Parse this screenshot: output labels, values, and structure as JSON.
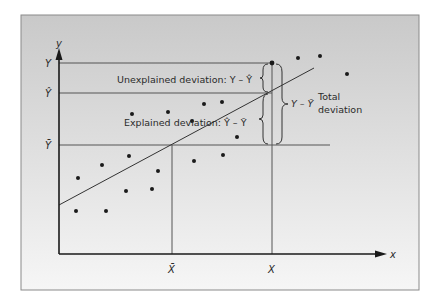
{
  "figure": {
    "frame": {
      "x": 21,
      "y": 15,
      "w": 398,
      "h": 275,
      "bg_top": "#c9c9c9",
      "bg_bottom": "#f6f6f6",
      "border": "#8a8a8a"
    },
    "axes": {
      "origin": {
        "x": 59,
        "y": 254
      },
      "y_top": 50,
      "x_right": 385,
      "y_axis_label": "y",
      "x_axis_label": "x",
      "color": "#1a1a1a"
    },
    "levels": {
      "Y": {
        "label": "Y",
        "y": 63,
        "x_end": 272
      },
      "Y_hat": {
        "label": "Ŷ",
        "y": 93,
        "x_end": 272
      },
      "Y_bar": {
        "label": "Ȳ",
        "y": 145,
        "x_end": 330
      }
    },
    "verticals": {
      "X_bar": {
        "label": "X̄",
        "x": 172
      },
      "X": {
        "label": "X",
        "x": 272
      }
    },
    "regression_line": {
      "x1": 59,
      "y1": 205,
      "x2": 314,
      "y2": 68
    },
    "highlight_point": {
      "x": 272,
      "y": 63
    },
    "points": [
      {
        "x": 76,
        "y": 211
      },
      {
        "x": 106,
        "y": 211
      },
      {
        "x": 78,
        "y": 178
      },
      {
        "x": 102,
        "y": 165
      },
      {
        "x": 126,
        "y": 191
      },
      {
        "x": 152,
        "y": 189
      },
      {
        "x": 158,
        "y": 171
      },
      {
        "x": 129,
        "y": 156
      },
      {
        "x": 132,
        "y": 114
      },
      {
        "x": 168,
        "y": 112
      },
      {
        "x": 194,
        "y": 161
      },
      {
        "x": 223,
        "y": 155
      },
      {
        "x": 204,
        "y": 104
      },
      {
        "x": 222,
        "y": 102
      },
      {
        "x": 192,
        "y": 121
      },
      {
        "x": 237,
        "y": 137
      },
      {
        "x": 298,
        "y": 58
      },
      {
        "x": 320,
        "y": 56
      },
      {
        "x": 347,
        "y": 74
      }
    ],
    "annotations": {
      "unexplained": {
        "text": "Unexplained deviation: Y – Ŷ",
        "x": 117,
        "y": 83
      },
      "explained": {
        "text": "Explained deviation: Ŷ – Ȳ",
        "x": 124,
        "y": 126
      },
      "total_formula": {
        "text": "Y – Ȳ",
        "x": 292,
        "y": 106
      },
      "total_line1": {
        "text": "Total",
        "x": 317,
        "y": 100
      },
      "total_line2": {
        "text": "deviation",
        "x": 317,
        "y": 115
      }
    }
  }
}
